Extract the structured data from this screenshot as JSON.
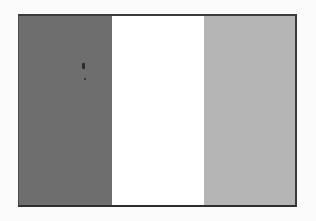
{
  "image": {
    "description": "Grayscale tricolor flag with three vertical stripes",
    "stripes": [
      {
        "name": "left",
        "color": "#6e6e6e"
      },
      {
        "name": "middle",
        "color": "#ffffff"
      },
      {
        "name": "right",
        "color": "#b5b5b5"
      }
    ],
    "border_color": "#333333",
    "background": "#fbfbfb",
    "speck_color": "#2a2a2a"
  }
}
